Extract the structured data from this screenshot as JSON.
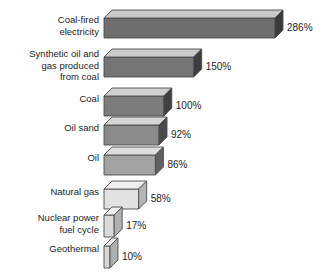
{
  "chart_data": {
    "type": "bar",
    "title": "",
    "subtitle": "",
    "xlabel": "",
    "ylabel": "",
    "orientation": "horizontal",
    "grid": false,
    "legend": null,
    "unit": "%",
    "xlim": [
      0,
      286
    ],
    "categories": [
      "Coal-fired\nelectricity",
      "Synthetic oil and\ngas produced\nfrom coal",
      "Coal",
      "Oil sand",
      "Oil",
      "Natural gas",
      "Nuclear power\nfuel cycle",
      "Geothermal"
    ],
    "values": [
      286,
      150,
      100,
      92,
      86,
      58,
      17,
      10
    ],
    "value_labels": [
      "286%",
      "150%",
      "100%",
      "92%",
      "86%",
      "58%",
      "17%",
      "10%"
    ],
    "bars": [
      {
        "label": "Coal-fired\nelectricity",
        "value": 286,
        "value_label": "286%",
        "face": "#6e6e6e",
        "top": "#c9c9c9",
        "side": "#3a3a3a"
      },
      {
        "label": "Synthetic oil and\ngas produced\nfrom coal",
        "value": 150,
        "value_label": "150%",
        "face": "#757575",
        "top": "#cbcbcb",
        "side": "#3d3d3d"
      },
      {
        "label": "Coal",
        "value": 100,
        "value_label": "100%",
        "face": "#7c7c7c",
        "top": "#cfcfcf",
        "side": "#404040"
      },
      {
        "label": "Oil sand",
        "value": 92,
        "value_label": "92%",
        "face": "#8a8a8a",
        "top": "#d6d6d6",
        "side": "#4a4a4a"
      },
      {
        "label": "Oil",
        "value": 86,
        "value_label": "86%",
        "face": "#a3a3a3",
        "top": "#dedede",
        "side": "#606060"
      },
      {
        "label": "Natural gas",
        "value": 58,
        "value_label": "58%",
        "face": "#e2e2e2",
        "top": "#f0f0f0",
        "side": "#b4b4b4"
      },
      {
        "label": "Nuclear power\nfuel cycle",
        "value": 17,
        "value_label": "17%",
        "face": "#dadada",
        "top": "#ededed",
        "side": "#b0b0b0"
      },
      {
        "label": "Geothermal",
        "value": 10,
        "value_label": "10%",
        "face": "#d8d8d8",
        "top": "#ebebeb",
        "side": "#aeaeae"
      }
    ]
  },
  "style": {
    "background": "#ffffff",
    "text_color": "#1c1c1c",
    "outline_color": "#4d4d4d"
  }
}
